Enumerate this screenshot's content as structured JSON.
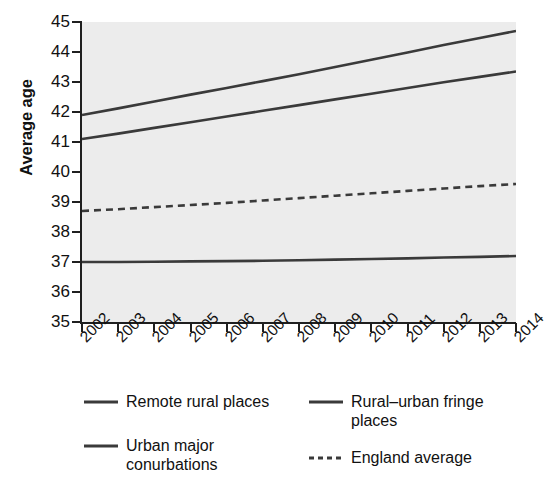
{
  "chart_data": {
    "type": "line",
    "title": "",
    "xlabel": "",
    "ylabel": "Average age",
    "x": [
      2002,
      2003,
      2004,
      2005,
      2006,
      2007,
      2008,
      2009,
      2010,
      2011,
      2012,
      2013,
      2014
    ],
    "xlim": [
      2002,
      2014
    ],
    "ylim": [
      35,
      45
    ],
    "yticks": [
      45,
      44,
      43,
      42,
      41,
      40,
      39,
      38,
      37,
      36,
      35
    ],
    "xticks": [
      "2002",
      "2003",
      "2004",
      "2005",
      "2006",
      "2007",
      "2008",
      "2009",
      "2010",
      "2011",
      "2012",
      "2013",
      "2014"
    ],
    "grid": false,
    "legend_position": "bottom",
    "series": [
      {
        "name": "Remote rural places",
        "style": "solid",
        "color": "#3a3a3a",
        "values": [
          41.9,
          42.12,
          42.35,
          42.58,
          42.8,
          43.03,
          43.26,
          43.5,
          43.74,
          43.98,
          44.23,
          44.47,
          44.7
        ]
      },
      {
        "name": "Rural–urban fringe places",
        "style": "solid",
        "color": "#3a3a3a",
        "values": [
          41.1,
          41.28,
          41.47,
          41.66,
          41.85,
          42.04,
          42.23,
          42.42,
          42.61,
          42.8,
          42.99,
          43.17,
          43.35
        ]
      },
      {
        "name": "England average",
        "style": "dashed",
        "color": "#3a3a3a",
        "values": [
          38.7,
          38.76,
          38.83,
          38.9,
          38.97,
          39.05,
          39.13,
          39.21,
          39.29,
          39.37,
          39.45,
          39.53,
          39.6
        ]
      },
      {
        "name": "Urban major conurbations",
        "style": "solid",
        "color": "#3a3a3a",
        "values": [
          37.0,
          37.0,
          37.01,
          37.02,
          37.03,
          37.04,
          37.06,
          37.08,
          37.1,
          37.12,
          37.15,
          37.17,
          37.2
        ]
      }
    ]
  },
  "axis": {
    "y_title": "Average age"
  },
  "legend": {
    "entries": [
      {
        "label": "Remote rural places",
        "style": "solid"
      },
      {
        "label": "Rural–urban fringe places",
        "style": "solid"
      },
      {
        "label": "Urban major conurbations",
        "style": "solid"
      },
      {
        "label": "England average",
        "style": "dashed"
      }
    ]
  },
  "colors": {
    "line": "#3a3a3a",
    "axis": "#1f1f1f",
    "panel_background": "#ececec",
    "text": "#111111"
  }
}
